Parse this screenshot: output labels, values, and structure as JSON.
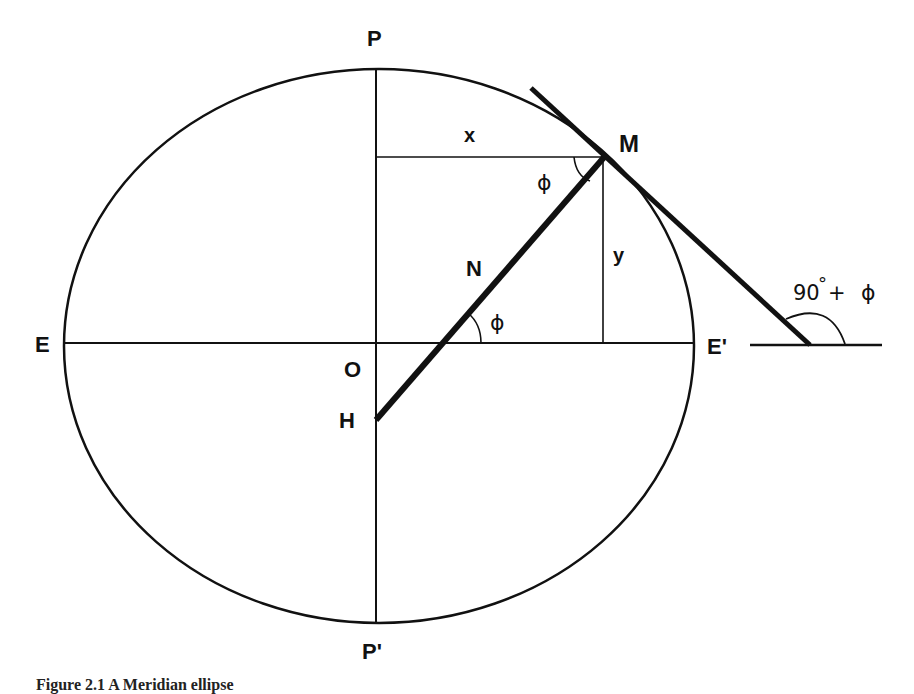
{
  "figure": {
    "type": "geometric-diagram",
    "ellipse": {
      "cx": 379,
      "cy": 346,
      "rx": 315,
      "ry": 277
    },
    "colors": {
      "stroke": "#111111",
      "background": "#ffffff"
    },
    "labels": {
      "north_pole": "P",
      "south_pole": "P'",
      "equator_west": "E",
      "equator_east": "E'",
      "center": "O",
      "normal_intersection": "H",
      "normal_label": "N",
      "point": "M",
      "x_coord": "x",
      "y_coord": "y",
      "angle_at_m": "ϕ",
      "angle_at_equator": "ϕ",
      "tangent_angle": "90°+ ϕ",
      "tangent_angle_number": "90",
      "tangent_angle_degree": "°",
      "tangent_angle_plus": "+",
      "tangent_angle_phi": "ϕ"
    }
  },
  "caption": {
    "text": "Figure 2.1 A Meridian ellipse"
  }
}
